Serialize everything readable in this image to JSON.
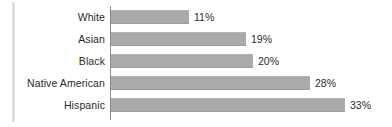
{
  "chart_data": {
    "type": "bar",
    "orientation": "horizontal",
    "title": "",
    "subtitle": "",
    "xlabel": "",
    "ylabel": "",
    "xlim": [
      0,
      33
    ],
    "grid": false,
    "legend": null,
    "bar_color": "#aaaaaa",
    "axis_color": "#8a8a8a",
    "label_color": "#2b2b2b",
    "value_suffix": "%",
    "categories": [
      "White",
      "Asian",
      "Black",
      "Native American",
      "Hispanic"
    ],
    "values": [
      11,
      19,
      20,
      28,
      33
    ],
    "data_labels": [
      "11%",
      "19%",
      "20%",
      "28%",
      "33%"
    ],
    "points": [
      {
        "category": "White",
        "value": 11,
        "label": "11%"
      },
      {
        "category": "Asian",
        "value": 19,
        "label": "19%"
      },
      {
        "category": "Black",
        "value": 20,
        "label": "20%"
      },
      {
        "category": "Native American",
        "value": 28,
        "label": "28%"
      },
      {
        "category": "Hispanic",
        "value": 33,
        "label": "33%"
      }
    ]
  },
  "icons": {
    "edge_artifact": "vertical-line-artifact"
  }
}
